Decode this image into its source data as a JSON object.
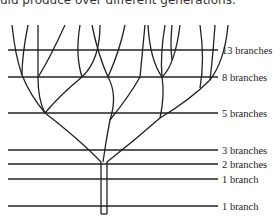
{
  "caption": "uld produce over different generations.",
  "diagram": {
    "levels": [
      {
        "label": "13 branches",
        "y": 50
      },
      {
        "label": "8 branches",
        "y": 77
      },
      {
        "label": "5 branches",
        "y": 113
      },
      {
        "label": "3 branches",
        "y": 150
      },
      {
        "label": "2 branches",
        "y": 164
      },
      {
        "label": "1 branch",
        "y": 179
      },
      {
        "label": "1 branch",
        "y": 206
      }
    ],
    "line_color": "#222222"
  }
}
